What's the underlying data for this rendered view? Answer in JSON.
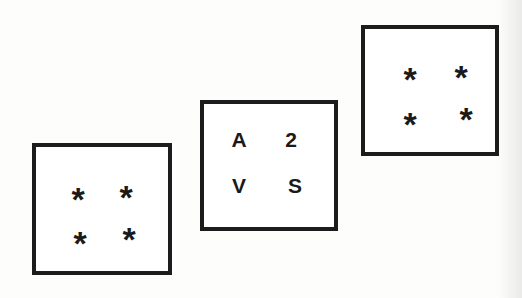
{
  "figure": {
    "cards": [
      {
        "id": "left",
        "position": {
          "x": 32,
          "y": 143,
          "w": 140,
          "h": 132
        },
        "items": [
          {
            "label": "*",
            "x": 42,
            "y": 38
          },
          {
            "label": "*",
            "x": 90,
            "y": 36
          },
          {
            "label": "*",
            "x": 44,
            "y": 82
          },
          {
            "label": "*",
            "x": 93,
            "y": 78
          }
        ]
      },
      {
        "id": "middle",
        "position": {
          "x": 200,
          "y": 100,
          "w": 138,
          "h": 131
        },
        "items": [
          {
            "label": "A",
            "x": 35,
            "y": 36
          },
          {
            "label": "2",
            "x": 87,
            "y": 36
          },
          {
            "label": "V",
            "x": 35,
            "y": 82
          },
          {
            "label": "S",
            "x": 91,
            "y": 82
          }
        ]
      },
      {
        "id": "right",
        "position": {
          "x": 361,
          "y": 25,
          "w": 138,
          "h": 131
        },
        "items": [
          {
            "label": "*",
            "x": 45,
            "y": 36
          },
          {
            "label": "*",
            "x": 96,
            "y": 34
          },
          {
            "label": "*",
            "x": 45,
            "y": 81
          },
          {
            "label": "*",
            "x": 101,
            "y": 76
          }
        ]
      }
    ],
    "colors": {
      "ink": "#1a1a1a",
      "border": "#1c1c1c",
      "paper": "#fdfdfc"
    }
  }
}
